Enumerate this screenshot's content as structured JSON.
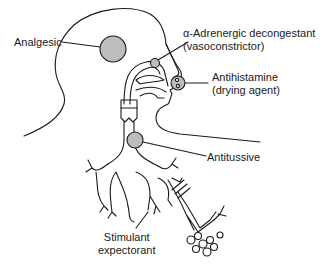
{
  "diagram": {
    "type": "anatomical-schematic",
    "fill_color": "#bdbdbd",
    "line_color": "#1a1a1a"
  },
  "labels": {
    "analgesic": "Analgesic",
    "decongestant_line1": "α-Adrenergic decongestant",
    "decongestant_line2": "(vasoconstrictor)",
    "antihistamine_line1": "Antihistamine",
    "antihistamine_line2": "(drying agent)",
    "antitussive": "Antitussive",
    "expectorant_line1": "Stimulant",
    "expectorant_line2": "expectorant"
  }
}
